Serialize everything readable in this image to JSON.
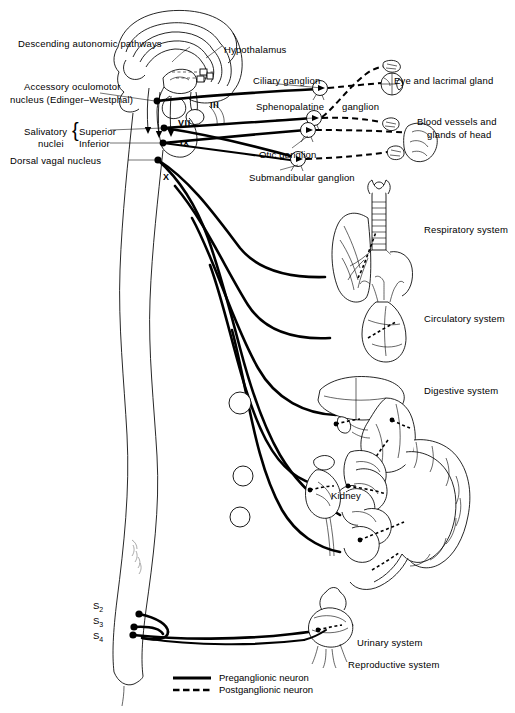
{
  "figure": {
    "background_color": "#ffffff",
    "ink_color": "#000000"
  },
  "labels": {
    "descending_pathways": "Descending autonomic pathways",
    "hypothalamus": "Hypothalamus",
    "accessory_oculomotor_line1": "Accessory oculomotor",
    "accessory_oculomotor_line2": "nucleus (Edinger–Westphal)",
    "salivatory_line1": "Salivatory",
    "salivatory_line2": "nuclei",
    "salivatory_superior": "Superior",
    "salivatory_inferior": "Inferior",
    "dorsal_vagal_nucleus": "Dorsal vagal nucleus",
    "ciliary_ganglion": "Ciliary ganglion",
    "sphenopalatine_ganglion_a": "Sphenopalatine",
    "sphenopalatine_ganglion_b": "ganglion",
    "otic_ganglion": "Otic ganglion",
    "submandibular_ganglion": "Submandibular ganglion",
    "eye_and_lacrimal_gland": "Eye and lacrimal gland",
    "blood_vessels_line1": "Blood vessels and",
    "blood_vessels_line2": "glands of head",
    "respiratory_system": "Respiratory system",
    "circulatory_system": "Circulatory system",
    "digestive_system": "Digestive system",
    "kidney": "Kidney",
    "urinary_system": "Urinary system",
    "reproductive_system": "Reproductive system"
  },
  "cranial_nerves": [
    {
      "numeral": "III"
    },
    {
      "numeral": "VII"
    },
    {
      "numeral": "IX"
    },
    {
      "numeral": "X"
    }
  ],
  "sacral_segments": [
    {
      "letter": "S",
      "number": "2"
    },
    {
      "letter": "S",
      "number": "3"
    },
    {
      "letter": "S",
      "number": "4"
    }
  ],
  "legend": {
    "preganglionic": "Preganglionic neuron",
    "postganglionic": "Postganglionic neuron",
    "preganglionic_style": "solid",
    "postganglionic_style": "dashed"
  }
}
